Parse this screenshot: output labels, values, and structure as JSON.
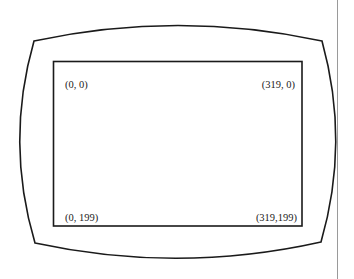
{
  "diagram": {
    "labels": {
      "top_left": "(0, 0)",
      "top_right": "(319, 0)",
      "bottom_left": "(0, 199)",
      "bottom_right": "(319,199)"
    },
    "colors": {
      "stroke": "#1a1a1a",
      "margin_line": "#9a9a9a",
      "background": "#ffffff"
    }
  }
}
